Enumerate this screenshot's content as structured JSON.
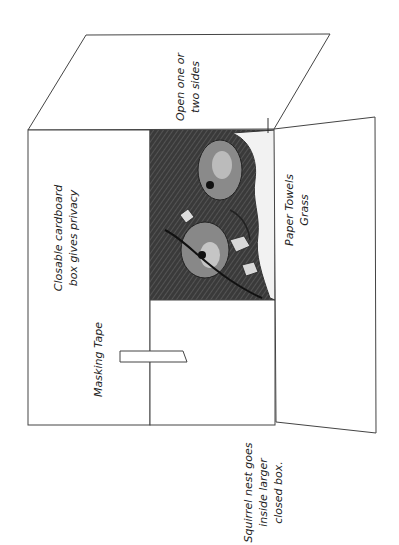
{
  "diagram": {
    "labels": {
      "top_flap": [
        "Open one or",
        "two sides"
      ],
      "front_face": [
        "Closable cardboard",
        "box gives privacy"
      ],
      "tape": "Masking Tape",
      "right_flap": [
        "Paper Towels",
        "Grass"
      ],
      "caption": [
        "Squirrel nest goes",
        "inside larger",
        "closed box."
      ]
    },
    "colors": {
      "line": "#444444",
      "background": "#ffffff",
      "sketch_dark": "#2a2a2a"
    }
  }
}
